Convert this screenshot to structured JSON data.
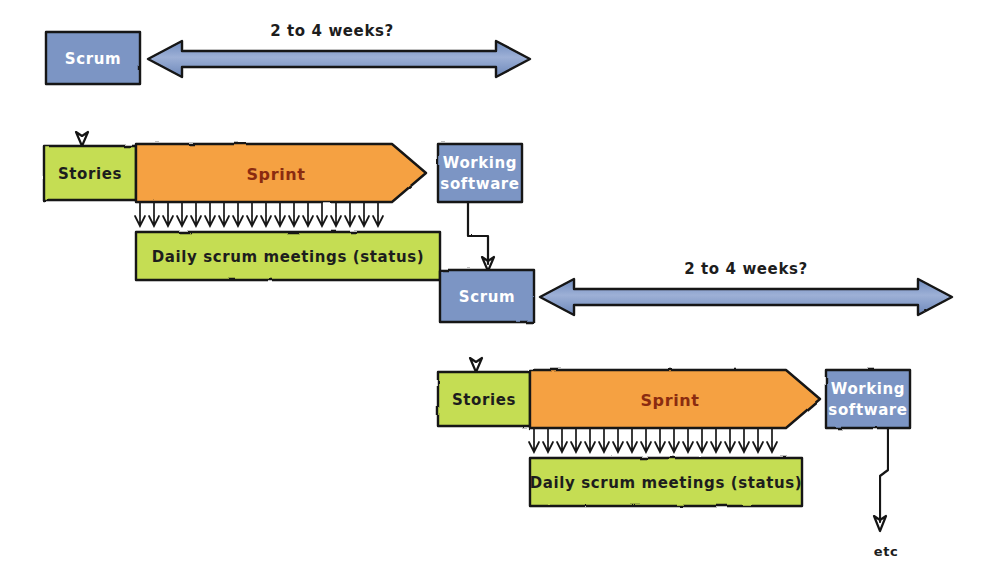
{
  "diagram": {
    "background_color": "#ffffff",
    "colors": {
      "blue_fill": "#7b95c4",
      "green_fill": "#c5dd52",
      "orange_fill": "#f5a142",
      "outline": "#141414",
      "blue_text": "#ffffff",
      "dark_text": "#1d1d1d",
      "sprint_text": "#8a2b10"
    },
    "labels": {
      "scrum": "Scrum",
      "stories": "Stories",
      "sprint": "Sprint",
      "working_software_line1": "Working",
      "working_software_line2": "software",
      "daily_scrum": "Daily scrum meetings (status)",
      "duration": "2 to 4 weeks?",
      "etc": "etc"
    },
    "cycles": [
      {
        "id": "cycle-1",
        "scrum_box": {
          "label": "Scrum",
          "x": 46,
          "y": 32,
          "w": 94,
          "h": 52
        },
        "duration_arrow": {
          "label": "2 to 4 weeks?",
          "x1": 148,
          "x2": 528,
          "y": 59
        },
        "stories_box": {
          "label": "Stories",
          "x": 44,
          "y": 146,
          "w": 92,
          "h": 54
        },
        "sprint_arrow": {
          "label": "Sprint",
          "x": 136,
          "y": 144,
          "w": 290,
          "h": 58,
          "tip": 34
        },
        "tick_count": 17,
        "daily_box": {
          "label": "Daily scrum meetings (status)",
          "x": 136,
          "y": 232,
          "w": 304,
          "h": 48
        },
        "working_box": {
          "line1": "Working",
          "line2": "software",
          "x": 438,
          "y": 144,
          "w": 84,
          "h": 58
        }
      },
      {
        "id": "cycle-2",
        "scrum_box": {
          "label": "Scrum",
          "x": 440,
          "y": 270,
          "w": 94,
          "h": 52
        },
        "duration_arrow": {
          "label": "2 to 4 weeks?",
          "x1": 542,
          "x2": 952,
          "y": 297
        },
        "stories_box": {
          "label": "Stories",
          "x": 438,
          "y": 372,
          "w": 92,
          "h": 54
        },
        "sprint_arrow": {
          "label": "Sprint",
          "x": 530,
          "y": 370,
          "w": 290,
          "h": 58,
          "tip": 34
        },
        "tick_count": 17,
        "daily_box": {
          "label": "Daily scrum meetings (status)",
          "x": 530,
          "y": 458,
          "w": 272,
          "h": 48
        },
        "working_box": {
          "line1": "Working",
          "line2": "software",
          "x": 826,
          "y": 370,
          "w": 84,
          "h": 58
        }
      }
    ],
    "terminal": {
      "label": "etc",
      "x": 886,
      "y": 550
    }
  }
}
